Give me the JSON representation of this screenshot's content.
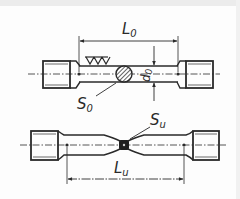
{
  "diagram": {
    "title": "",
    "specimen_before": {
      "gauge_length_label": "L",
      "gauge_length_sub": "0",
      "diameter_label": "d",
      "diameter_sub": "0",
      "cross_section_label": "S",
      "cross_section_sub": "0",
      "surface_finish_symbol": "VVV"
    },
    "specimen_after": {
      "gauge_length_label": "L",
      "gauge_length_sub": "u",
      "cross_section_label": "S",
      "cross_section_sub": "u"
    },
    "colors": {
      "line": "#2a2a2a",
      "background": "#fdfdfd",
      "hatch": "#3a3a3a"
    }
  }
}
